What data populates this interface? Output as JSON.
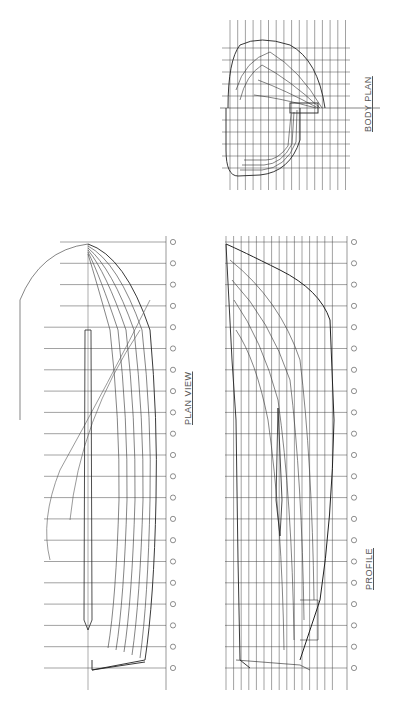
{
  "drawing": {
    "type": "lines plan",
    "orientation": "rotated 90 degrees counter-clockwise",
    "views": {
      "plan_view": {
        "title": "PLAN VIEW"
      },
      "profile": {
        "title": "PROFILE"
      },
      "body_plan": {
        "title": "BODY PLAN"
      }
    },
    "stations": [
      "0",
      "1",
      "2",
      "3",
      "4",
      "5",
      "6",
      "7",
      "8",
      "9",
      "10",
      "11",
      "12",
      "13",
      "14",
      "15",
      "16",
      "17",
      "18",
      "19",
      "20"
    ],
    "profile_labels": {
      "baseline": "BASELINE",
      "dwl": "W.L. 0 (DWL)"
    },
    "waterlines": [
      "WL 8",
      "WL 7",
      "WL 6",
      "WL 5",
      "WL 4",
      "WL 3",
      "WL 2",
      "WL 1",
      "W.L. 0 (DWL)",
      "WL -1",
      "WL -2",
      "WL -3",
      "WL -4",
      "WL -5",
      "BASELINE"
    ],
    "buttocks": [
      "B 1",
      "B 2",
      "B 3",
      "B 4"
    ],
    "colors": {
      "line": "#222222",
      "grid": "#444444",
      "label": "#555555",
      "background": "#ffffff"
    }
  }
}
